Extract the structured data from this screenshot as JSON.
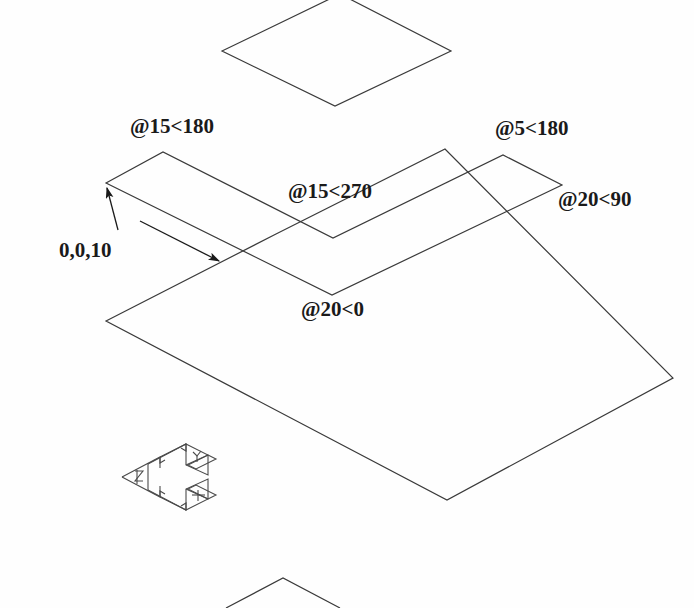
{
  "drawing": {
    "title": "Isometric polar-coordinate construction drawing",
    "background_color": "#fefefe",
    "line_color": "#3a3a3a",
    "text_color": "#1a1a1a",
    "line_width": 1.2,
    "annotations": {
      "start_point": "0,0,10",
      "segment_1": "@15<180",
      "segment_2": "@15<270",
      "segment_3": "@20<0",
      "segment_4": "@20<90",
      "segment_5": "@5<180"
    },
    "ucs_icon": {
      "name": "ucs-isometric-axis-icon",
      "x_axis_label": "X",
      "y_axis_label": "Y",
      "z_axis_label": "Z"
    },
    "shapes": {
      "top_diamond": "isometric square outline (top)",
      "chevron_band": "V-shaped band formed by two parallelogram arms",
      "base_parallelogram": "large isometric base plane",
      "bottom_partial_diamond": "partially visible diamond apex at bottom edge"
    }
  }
}
